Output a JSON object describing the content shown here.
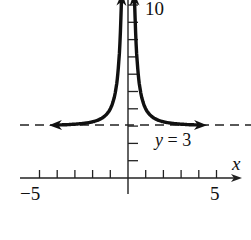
{
  "chart_data": {
    "type": "line",
    "title": "",
    "function": "y = 3 + 1/x^2",
    "xlabel": "x",
    "ylabel": "",
    "xlim": [
      -5.5,
      6
    ],
    "ylim": [
      -1,
      10.5
    ],
    "x_tick_labels": [
      {
        "value": -5,
        "label": "−5"
      },
      {
        "value": 5,
        "label": "5"
      }
    ],
    "y_tick_labels": [
      {
        "value": 10,
        "label": "10"
      }
    ],
    "x_ticks": [
      -5,
      -4,
      -3,
      -2,
      -1,
      1,
      2,
      3,
      4,
      5
    ],
    "y_ticks": [
      1,
      2,
      3,
      4,
      5,
      6,
      7,
      8,
      9,
      10
    ],
    "asymptotes": [
      {
        "type": "horizontal",
        "value": 3,
        "label": "y = 3",
        "style": "dashed"
      },
      {
        "type": "vertical",
        "value": 0
      }
    ],
    "series": [
      {
        "name": "left branch",
        "x": [
          -4.5,
          -3,
          -2,
          -1.5,
          -1,
          -0.8,
          -0.6,
          -0.5,
          -0.4,
          -0.35
        ],
        "values": [
          3.05,
          3.11,
          3.25,
          3.44,
          4.0,
          4.56,
          5.78,
          7.0,
          9.25,
          11.16
        ]
      },
      {
        "name": "right branch",
        "x": [
          0.35,
          0.4,
          0.5,
          0.6,
          0.8,
          1,
          1.5,
          2,
          3,
          4.5
        ],
        "values": [
          11.16,
          9.25,
          7.0,
          5.78,
          4.56,
          4.0,
          3.44,
          3.25,
          3.11,
          3.05
        ]
      }
    ],
    "grid": false,
    "legend": null,
    "colors": {
      "curve": "#111111",
      "axis": "#222222",
      "asymptote": "#222222"
    }
  },
  "labels": {
    "x_axis_var": "x",
    "x_min_label": "−5",
    "x_max_label": "5",
    "y_max_label": "10",
    "asymptote_var": "y",
    "asymptote_rest": " = 3"
  }
}
